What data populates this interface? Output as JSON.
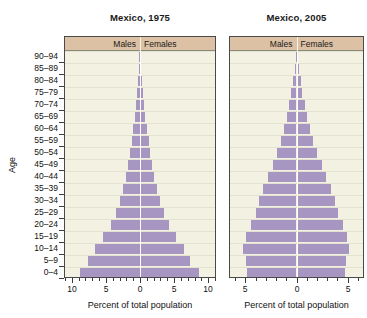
{
  "figure": {
    "y_axis_title": "Age",
    "bar_color": "#a796c1",
    "panel_background": "#f2f1e2",
    "header_background": "#dcc1a4"
  },
  "chart_data": {
    "type": "bar",
    "xlabel": "Percent of total population",
    "ylabel": "Age",
    "grid": true,
    "legend_position": "top-inside",
    "categories": [
      "0–4",
      "5–9",
      "10–14",
      "15–19",
      "20–24",
      "25–29",
      "30–34",
      "35–39",
      "40–44",
      "45–49",
      "50–54",
      "55–59",
      "60–64",
      "65–69",
      "70–74",
      "75–79",
      "80–84",
      "85–89",
      "90–94"
    ],
    "panels": [
      {
        "title": "Mexico, 1975",
        "legend": [
          "Males",
          "Females"
        ],
        "xlim": [
          -11,
          11
        ],
        "xticks_major": [
          -10,
          -5,
          0,
          5,
          10
        ],
        "xticklabels": [
          "10",
          "5",
          "0",
          "5",
          "10"
        ],
        "xtick_minor_step": 1,
        "series": [
          {
            "name": "Males",
            "values": [
              8.8,
              7.6,
              6.6,
              5.4,
              4.3,
              3.5,
              2.9,
              2.5,
              2.1,
              1.8,
              1.5,
              1.2,
              1.0,
              0.75,
              0.55,
              0.38,
              0.25,
              0.14,
              0.07
            ]
          },
          {
            "name": "Females",
            "values": [
              8.6,
              7.4,
              6.4,
              5.3,
              4.3,
              3.5,
              2.9,
              2.5,
              2.1,
              1.8,
              1.5,
              1.25,
              1.0,
              0.8,
              0.6,
              0.42,
              0.28,
              0.16,
              0.08
            ]
          }
        ]
      },
      {
        "title": "Mexico, 2005",
        "legend": [
          "Males",
          "Females"
        ],
        "xlim": [
          -6.5,
          6.5
        ],
        "xticks_major": [
          -5,
          0,
          5
        ],
        "xticklabels": [
          "5",
          "0",
          "5"
        ],
        "xtick_minor_step": 1,
        "series": [
          {
            "name": "Males",
            "values": [
              4.8,
              4.9,
              5.2,
              4.9,
              4.4,
              4.0,
              3.7,
              3.3,
              2.8,
              2.3,
              1.9,
              1.5,
              1.2,
              0.95,
              0.7,
              0.5,
              0.33,
              0.18,
              0.09
            ]
          },
          {
            "name": "Females",
            "values": [
              4.7,
              4.8,
              5.1,
              4.9,
              4.5,
              4.1,
              3.8,
              3.4,
              2.9,
              2.45,
              2.0,
              1.6,
              1.3,
              1.05,
              0.8,
              0.58,
              0.4,
              0.22,
              0.11
            ]
          }
        ]
      }
    ]
  }
}
